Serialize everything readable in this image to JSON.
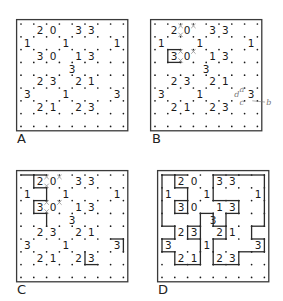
{
  "figure": {
    "type": "slitherlink-solving-steps",
    "grid": {
      "rows": 8,
      "cols": 8
    },
    "clues": [
      {
        "r": 0,
        "c": 1,
        "v": "2"
      },
      {
        "r": 0,
        "c": 2,
        "v": "0"
      },
      {
        "r": 0,
        "c": 4,
        "v": "3"
      },
      {
        "r": 0,
        "c": 5,
        "v": "3"
      },
      {
        "r": 1,
        "c": 0,
        "v": "1"
      },
      {
        "r": 1,
        "c": 3,
        "v": "1"
      },
      {
        "r": 1,
        "c": 7,
        "v": "1"
      },
      {
        "r": 2,
        "c": 1,
        "v": "3"
      },
      {
        "r": 2,
        "c": 2,
        "v": "0"
      },
      {
        "r": 2,
        "c": 4,
        "v": "1"
      },
      {
        "r": 2,
        "c": 5,
        "v": "3"
      },
      {
        "r": 3,
        "c": 3.5,
        "v": "3"
      },
      {
        "r": 4,
        "c": 1,
        "v": "2"
      },
      {
        "r": 4,
        "c": 2,
        "v": "3"
      },
      {
        "r": 4,
        "c": 4,
        "v": "2"
      },
      {
        "r": 4,
        "c": 5,
        "v": "1"
      },
      {
        "r": 5,
        "c": 0,
        "v": "3"
      },
      {
        "r": 5,
        "c": 3,
        "v": "1"
      },
      {
        "r": 5,
        "c": 7,
        "v": "3"
      },
      {
        "r": 6,
        "c": 1,
        "v": "2"
      },
      {
        "r": 6,
        "c": 2,
        "v": "1"
      },
      {
        "r": 6,
        "c": 4,
        "v": "2"
      },
      {
        "r": 6,
        "c": 5,
        "v": "3"
      }
    ],
    "panels": [
      {
        "label": "A",
        "x": 16,
        "y": 19,
        "crosses": [],
        "lines": [],
        "annotations": []
      },
      {
        "label": "B",
        "x": 150,
        "y": 19,
        "crosses": [
          [
            0,
            2
          ],
          [
            0,
            3
          ],
          [
            1,
            2
          ],
          [
            2,
            2
          ],
          [
            2,
            3
          ],
          [
            3,
            2
          ]
        ],
        "lines": [
          [
            [
              2,
              1
            ],
            [
              2,
              2
            ]
          ],
          [
            [
              3,
              1
            ],
            [
              3,
              2
            ]
          ],
          [
            [
              2,
              1
            ],
            [
              3,
              1
            ]
          ]
        ],
        "annotations": [
          {
            "text": "a",
            "r": 5.35,
            "c": 6.6
          },
          {
            "text": "d",
            "r": 5.7,
            "c": 6.2
          },
          {
            "text": "c",
            "r": 6.35,
            "c": 6.6
          },
          {
            "text": "b",
            "r": 6.3,
            "c": 8.7
          }
        ]
      },
      {
        "label": "C",
        "x": 16,
        "y": 170,
        "crosses": [
          [
            0,
            2
          ],
          [
            0,
            3
          ],
          [
            1,
            2
          ],
          [
            2,
            2
          ],
          [
            2,
            3
          ],
          [
            3,
            2
          ]
        ],
        "lines": [
          [
            [
              0,
              0
            ],
            [
              0,
              1
            ]
          ],
          [
            [
              0,
              1
            ],
            [
              1,
              1
            ]
          ],
          [
            [
              1,
              1
            ],
            [
              1,
              2
            ]
          ],
          [
            [
              0,
              1
            ],
            [
              0,
              2
            ]
          ],
          [
            [
              0,
              1
            ],
            [
              0,
              1
            ]
          ],
          [
            [
              1,
              2
            ],
            [
              2,
              2
            ]
          ],
          [
            [
              2,
              1
            ],
            [
              2,
              2
            ]
          ],
          [
            [
              2,
              1
            ],
            [
              3,
              1
            ]
          ],
          [
            [
              3,
              1
            ],
            [
              3,
              2
            ]
          ],
          [
            [
              3,
              2
            ],
            [
              4,
              2
            ]
          ],
          [
            [
              5,
              7
            ],
            [
              5,
              8
            ]
          ],
          [
            [
              5,
              8
            ],
            [
              6,
              8
            ]
          ],
          [
            [
              6,
              5
            ],
            [
              7,
              5
            ]
          ],
          [
            [
              7,
              5
            ],
            [
              7,
              6
            ]
          ]
        ],
        "annotations": []
      },
      {
        "label": "D",
        "x": 157,
        "y": 170,
        "crosses": [],
        "lines": [
          [
            [
              0,
              0
            ],
            [
              0,
              1
            ]
          ],
          [
            [
              0,
              0
            ],
            [
              4,
              0
            ]
          ],
          [
            [
              0,
              1
            ],
            [
              1,
              1
            ]
          ],
          [
            [
              1,
              1
            ],
            [
              1,
              2
            ]
          ],
          [
            [
              1,
              2
            ],
            [
              3,
              2
            ]
          ],
          [
            [
              0,
              1
            ],
            [
              0,
              2
            ]
          ],
          [
            [
              0,
              4
            ],
            [
              0,
              6
            ]
          ],
          [
            [
              0,
              4
            ],
            [
              1,
              4
            ]
          ],
          [
            [
              1,
              4
            ],
            [
              2,
              4
            ]
          ],
          [
            [
              0,
              6
            ],
            [
              0,
              8
            ]
          ],
          [
            [
              0,
              8
            ],
            [
              4,
              8
            ]
          ],
          [
            [
              2,
              1
            ],
            [
              2,
              2
            ]
          ],
          [
            [
              2,
              1
            ],
            [
              3,
              1
            ]
          ],
          [
            [
              3,
              1
            ],
            [
              3,
              2
            ]
          ],
          [
            [
              2,
              4
            ],
            [
              2,
              6
            ]
          ],
          [
            [
              2,
              6
            ],
            [
              3,
              6
            ]
          ],
          [
            [
              3,
              5
            ],
            [
              3,
              6
            ]
          ],
          [
            [
              3,
              5
            ],
            [
              5,
              5
            ]
          ],
          [
            [
              3,
              3
            ],
            [
              3,
              4
            ]
          ],
          [
            [
              3,
              3
            ],
            [
              4,
              3
            ]
          ],
          [
            [
              3,
              4
            ],
            [
              4,
              4
            ]
          ],
          [
            [
              4,
              4
            ],
            [
              4,
              5
            ]
          ],
          [
            [
              4,
              0
            ],
            [
              4,
              1
            ]
          ],
          [
            [
              4,
              1
            ],
            [
              5,
              1
            ]
          ],
          [
            [
              4,
              2
            ],
            [
              4,
              3
            ]
          ],
          [
            [
              4,
              2
            ],
            [
              5,
              2
            ]
          ],
          [
            [
              5,
              2
            ],
            [
              5,
              3
            ]
          ],
          [
            [
              4,
              3
            ],
            [
              5,
              3
            ]
          ],
          [
            [
              5,
              3
            ],
            [
              6,
              3
            ]
          ],
          [
            [
              4,
              7
            ],
            [
              4,
              8
            ]
          ],
          [
            [
              4,
              7
            ],
            [
              5,
              7
            ]
          ],
          [
            [
              5,
              7
            ],
            [
              5,
              8
            ]
          ],
          [
            [
              5,
              8
            ],
            [
              6,
              8
            ]
          ],
          [
            [
              6,
              7
            ],
            [
              6,
              8
            ]
          ],
          [
            [
              5,
              0
            ],
            [
              5,
              1
            ]
          ],
          [
            [
              5,
              0
            ],
            [
              6,
              0
            ]
          ],
          [
            [
              6,
              0
            ],
            [
              6,
              1
            ]
          ],
          [
            [
              6,
              1
            ],
            [
              7,
              1
            ]
          ],
          [
            [
              7,
              1
            ],
            [
              7,
              3
            ]
          ],
          [
            [
              6,
              3
            ],
            [
              7,
              3
            ]
          ],
          [
            [
              5,
              4
            ],
            [
              6,
              4
            ]
          ],
          [
            [
              5,
              4
            ],
            [
              5,
              5
            ]
          ],
          [
            [
              6,
              4
            ],
            [
              7,
              4
            ]
          ],
          [
            [
              7,
              4
            ],
            [
              7,
              6
            ]
          ],
          [
            [
              6,
              6
            ],
            [
              7,
              6
            ]
          ],
          [
            [
              6,
              6
            ],
            [
              6,
              7
            ]
          ]
        ],
        "annotations": []
      }
    ]
  },
  "style": {
    "frame_color": "#3a3a3a",
    "dot_color": "#1a1a1a",
    "line_color": "#2a2a2a",
    "cross_color": "#9a9a9a",
    "annotation_color": "#777777"
  }
}
